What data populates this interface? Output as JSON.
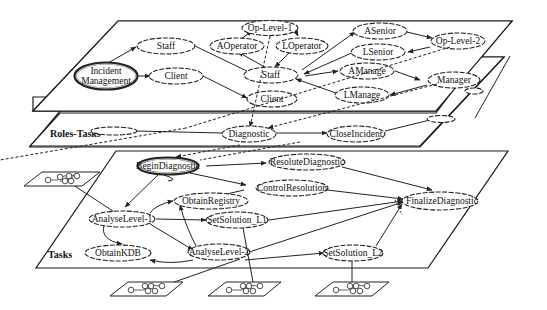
{
  "layers": {
    "roles": "Roles",
    "roles_tasks": "Roles-Tasks",
    "tasks": "Tasks"
  },
  "roles_nodes": {
    "incident_management_1": "Incident",
    "incident_management_2": "Management",
    "staff_left": "Staff",
    "client_left": "Client",
    "op_level_1": "Op-Level-1",
    "aoperator": "AOperator",
    "loperator": "LOperator",
    "staff_center": "Staff",
    "client_center": "Client",
    "asenior": "ASenior",
    "lsenior": "LSenior",
    "op_level_2": "Op-Level-2",
    "amanage": "AManage",
    "lmanage": "LManage",
    "manager": "Manager"
  },
  "roles_tasks_nodes": {
    "diagnostic": "Diagnostic",
    "close_incident": "CloseIncident",
    "left_blank": "",
    "right_blank": ""
  },
  "tasks_nodes": {
    "begin_diagnostic": "BeginDiagnostic",
    "resolute_diagnostic": "ResoluteDiagnostic",
    "control_resolution": "ControlResolution",
    "obtain_registry": "ObtainRegistry",
    "analyse_level_1": "AnalyseLevel-1",
    "set_solution_l1": "SetSolution_L1",
    "finalize_diagnostic": "FinalizeDiagnostic",
    "obtain_kdb": "ObtainKDB",
    "analyse_level_2": "AnalyseLevel-2",
    "set_solution_l2": "SetSolution_L2"
  },
  "sub_workflows": [
    {
      "id": "sub-workflow-left",
      "attached_to": "AnalyseLevel-1"
    },
    {
      "id": "sub-workflow-1",
      "attached_to": "AnalyseLevel-2"
    },
    {
      "id": "sub-workflow-2",
      "attached_to": "SetSolution_L1"
    },
    {
      "id": "sub-workflow-3",
      "attached_to": "SetSolution_L2"
    }
  ],
  "colors": {
    "stroke": "#222222",
    "background": "#ffffff"
  }
}
